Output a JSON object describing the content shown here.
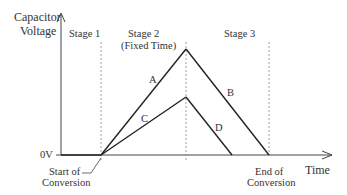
{
  "diagram": {
    "y_axis_label_line1": "Capacitor",
    "y_axis_label_line2": "Voltage",
    "x_axis_label": "Time",
    "zero_label": "0V",
    "stages": {
      "stage1": "Stage 1",
      "stage2_line1": "Stage 2",
      "stage2_line2": "(Fixed Time)",
      "stage3": "Stage 3"
    },
    "markers": {
      "start_line1": "Start of",
      "start_line2": "Conversion",
      "end_line1": "End of",
      "end_line2": "Conversion"
    },
    "segments": {
      "A": "A",
      "B": "B",
      "C": "C",
      "D": "D"
    },
    "colors": {
      "line": "#222222",
      "axis": "#333333",
      "dashed": "#888888"
    }
  }
}
